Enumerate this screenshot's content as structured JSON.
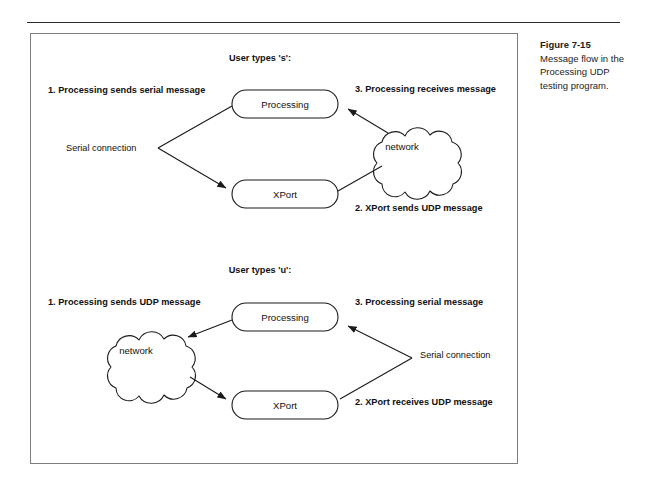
{
  "figure": {
    "caption_title": "Figure 7-15",
    "caption_body": "Message flow in the Processing UDP testing program."
  },
  "diagram_top": {
    "heading": "User types 's':",
    "step1": "1. Processing sends serial message",
    "step3": "3. Processing receives message",
    "step2": "2. XPort sends UDP message",
    "link_label": "Serial connection",
    "node_processing": "Processing",
    "node_xport": "XPort",
    "node_network": "network"
  },
  "diagram_bottom": {
    "heading": "User types 'u':",
    "step1": "1. Processing sends UDP message",
    "step3": "3. Processing serial message",
    "step2": "2. XPort receives UDP message",
    "link_label": "Serial connection",
    "node_processing": "Processing",
    "node_xport": "XPort",
    "node_network": "network"
  },
  "colors": {
    "ink": "#1a1a1a",
    "frame": "#7d7d7d",
    "page": "#ffffff"
  }
}
